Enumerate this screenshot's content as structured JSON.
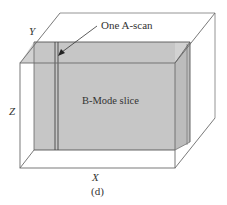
{
  "figure": {
    "caption": "(d)",
    "axes": {
      "x_label": "X",
      "y_label": "Y",
      "z_label": "Z"
    },
    "annotations": {
      "a_scan_label": "One A-scan",
      "b_mode_label": "B-Mode slice"
    },
    "colors": {
      "box_edge": "#6a6a6a",
      "slice_fill": "#c9c9c9",
      "slice_edge": "#555555",
      "background": "#ffffff"
    }
  }
}
